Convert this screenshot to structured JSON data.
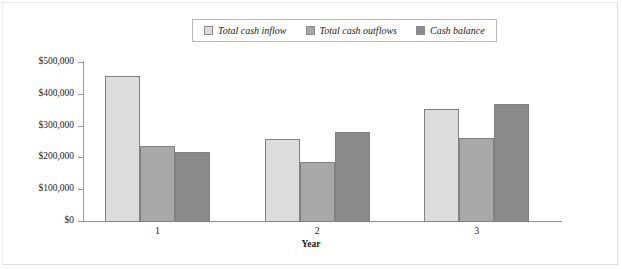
{
  "legend": {
    "position": "top-center",
    "entries": [
      {
        "label": "Total cash inflow",
        "color": "#dcdcdc"
      },
      {
        "label": "Total cash outflows",
        "color": "#a8a8a8"
      },
      {
        "label": "Cash balance",
        "color": "#8a8a8a"
      }
    ]
  },
  "axes": {
    "y_tick_labels": [
      "$500,000",
      "$400,000",
      "$300,000",
      "$200,000",
      "$100,000",
      "$0"
    ],
    "x_tick_labels": [
      "1",
      "2",
      "3"
    ],
    "x_title": "Year"
  },
  "chart_data": {
    "type": "bar",
    "title": "",
    "xlabel": "Year",
    "ylabel": "",
    "categories": [
      "1",
      "2",
      "3"
    ],
    "series": [
      {
        "name": "Total cash inflow",
        "color": "#dcdcdc",
        "values": [
          460000,
          260000,
          355000
        ]
      },
      {
        "name": "Total cash outflows",
        "color": "#a8a8a8",
        "values": [
          238000,
          190000,
          265000
        ]
      },
      {
        "name": "Cash balance",
        "color": "#8a8a8a",
        "values": [
          220000,
          282000,
          370000
        ]
      }
    ],
    "ylim": [
      0,
      500000
    ],
    "ytick_values": [
      0,
      100000,
      200000,
      300000,
      400000,
      500000
    ],
    "grid": false,
    "legend_position": "top-center"
  }
}
